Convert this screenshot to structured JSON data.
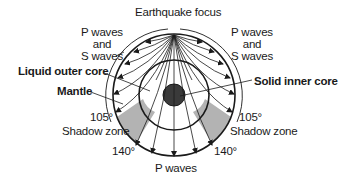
{
  "diagram": {
    "labels": {
      "focus": "Earthquake focus",
      "ps_left_1": "P waves",
      "ps_left_2": "and",
      "ps_left_3": "S waves",
      "ps_right_1": "P waves",
      "ps_right_2": "and",
      "ps_right_3": "S waves",
      "outer_core": "Liquid outer core",
      "mantle": "Mantle",
      "inner_core": "Solid inner core",
      "deg105_left": "105°",
      "deg105_right": "105°",
      "shadow_left": "Shadow zone",
      "shadow_right": "Shadow zone",
      "deg140_left": "140°",
      "deg140_right": "140°",
      "p_waves_bottom": "P waves"
    },
    "colors": {
      "line": "#1a1a1a",
      "shadow_zone": "#b3b3b3",
      "inner_core": "#3a3a3a"
    }
  }
}
